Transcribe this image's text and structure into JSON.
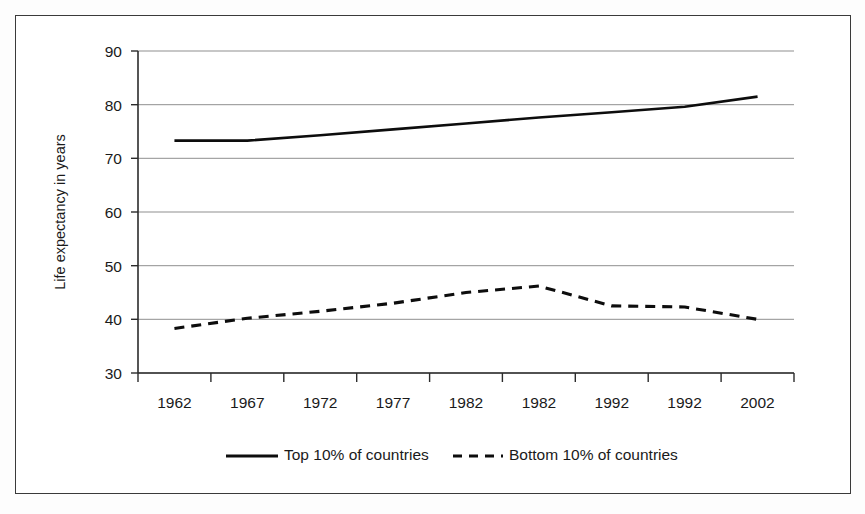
{
  "chart_data": {
    "type": "line",
    "title": "",
    "xlabel": "",
    "ylabel": "Life expectancy in years",
    "categories": [
      "1962",
      "1967",
      "1972",
      "1977",
      "1982",
      "1982",
      "1992",
      "1992",
      "2002"
    ],
    "ylim": [
      30,
      90
    ],
    "y_ticks": [
      "30",
      "40",
      "50",
      "60",
      "70",
      "80",
      "90"
    ],
    "grid": "horizontal",
    "legend_position": "bottom",
    "series": [
      {
        "name": "Top 10% of countries",
        "style": "solid",
        "color": "#0d0d0d",
        "values": [
          73.3,
          73.3,
          74.3,
          75.4,
          76.5,
          77.6,
          78.6,
          79.6,
          81.5
        ]
      },
      {
        "name": "Bottom 10% of countries",
        "style": "dashed",
        "color": "#0d0d0d",
        "values": [
          38.3,
          40.2,
          41.5,
          43.0,
          45.0,
          46.2,
          42.5,
          42.3,
          40.0
        ]
      }
    ]
  },
  "axis": {
    "y_title": "Life expectancy in years",
    "y_tick_0": "30",
    "y_tick_1": "40",
    "y_tick_2": "50",
    "y_tick_3": "60",
    "y_tick_4": "70",
    "y_tick_5": "80",
    "y_tick_6": "90",
    "x_tick_0": "1962",
    "x_tick_1": "1967",
    "x_tick_2": "1972",
    "x_tick_3": "1977",
    "x_tick_4": "1982",
    "x_tick_5": "1982",
    "x_tick_6": "1992",
    "x_tick_7": "1992",
    "x_tick_8": "2002"
  },
  "legend": {
    "entry_0_label": "Top 10% of countries",
    "entry_1_label": "Bottom 10% of countries"
  }
}
